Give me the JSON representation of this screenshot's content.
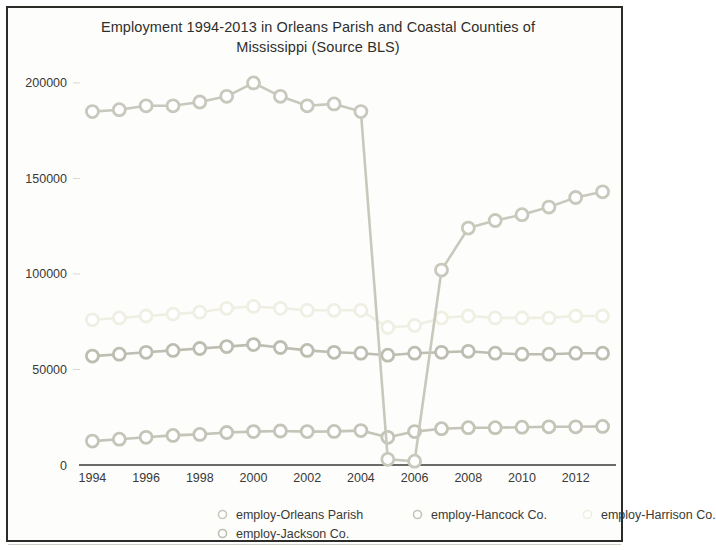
{
  "chart_data": {
    "type": "line",
    "title": "Employment 1994-2013 in Orleans Parish and Coastal Counties of Mississippi (Source BLS)",
    "title_line1": "Employment 1994-2013 in Orleans Parish and Coastal Counties of",
    "title_line2": "Mississippi (Source BLS)",
    "xlabel": "",
    "ylabel": "",
    "x": [
      1994,
      1995,
      1996,
      1997,
      1998,
      1999,
      2000,
      2001,
      2002,
      2003,
      2004,
      2005,
      2006,
      2007,
      2008,
      2009,
      2010,
      2011,
      2012,
      2013
    ],
    "xlim": [
      1993.5,
      2013.5
    ],
    "ylim": [
      0,
      212000
    ],
    "xticks": [
      1994,
      1996,
      1998,
      2000,
      2002,
      2004,
      2006,
      2008,
      2010,
      2012
    ],
    "xticklabels": [
      "1994",
      "1996",
      "1998",
      "2000",
      "2002",
      "2004",
      "2006",
      "2008",
      "2010",
      "2012"
    ],
    "yticks": [
      0,
      50000,
      100000,
      150000,
      200000
    ],
    "yticklabels": [
      "0",
      "50000",
      "100000",
      "150000",
      "200000"
    ],
    "grid": false,
    "legend_position": "bottom",
    "marker": "circle-open",
    "series": [
      {
        "name": "employ-Orleans Parish",
        "color": "#c8c8bd",
        "values": [
          185000,
          186000,
          188000,
          188000,
          190000,
          193000,
          200000,
          193000,
          188000,
          189000,
          185000,
          3000,
          2000,
          102000,
          124000,
          128000,
          131000,
          135000,
          140000,
          143000
        ]
      },
      {
        "name": "employ-Hancock Co.",
        "color": "#c4c4b8",
        "values": [
          12500,
          13500,
          14500,
          15500,
          16000,
          17000,
          17500,
          17800,
          17500,
          17600,
          18000,
          14500,
          17500,
          19000,
          19500,
          19500,
          19800,
          20000,
          20000,
          20200
        ]
      },
      {
        "name": "employ-Harrison Co.",
        "color": "#efefe4",
        "values": [
          76000,
          77000,
          78000,
          79000,
          80000,
          82000,
          83000,
          82000,
          81000,
          81000,
          81000,
          72000,
          73000,
          77000,
          78000,
          77000,
          77000,
          77000,
          78000,
          78000
        ]
      },
      {
        "name": "employ-Jackson Co.",
        "color": "#bdbdb1",
        "values": [
          57000,
          58000,
          59000,
          60000,
          61000,
          62000,
          63000,
          61500,
          60000,
          59000,
          58500,
          57500,
          58500,
          59000,
          59500,
          58500,
          58000,
          58000,
          58500,
          58500
        ]
      }
    ]
  },
  "legend": {
    "rows": [
      [
        "employ-Orleans Parish",
        "employ-Hancock Co.",
        "employ-Harrison Co."
      ],
      [
        "employ-Jackson Co."
      ]
    ]
  }
}
